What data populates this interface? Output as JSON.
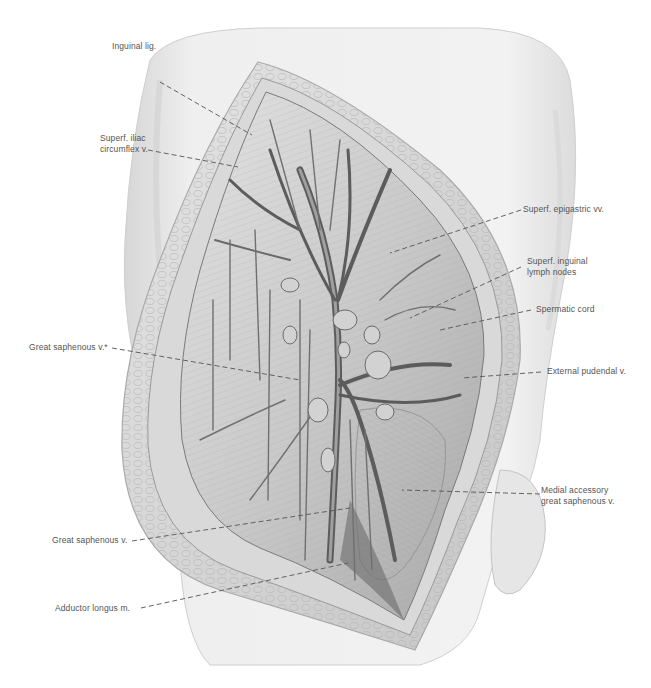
{
  "figure": {
    "colors": {
      "background": "#ffffff",
      "skin": "#ececec",
      "skin_shadow": "#c8c8c8",
      "wound_edge": "#d4d4d4",
      "fat_lobules": "#bdbdbd",
      "muscle": "#9a9a9a",
      "vessel": "#6e6e6e",
      "vessel_dark": "#3a3a3a",
      "label_text": "#555555",
      "leader_line": "#555555"
    }
  },
  "labels": [
    {
      "id": "inguinal-lig",
      "text": "Inguinal lig.",
      "side": "left"
    },
    {
      "id": "superf-iliac-circumflex-v",
      "line1": "Superf. iliac",
      "line2": "circumflex v.",
      "side": "left"
    },
    {
      "id": "superf-epigastric-vv",
      "text": "Superf. epigastric vv.",
      "side": "right"
    },
    {
      "id": "superf-inguinal-lymph-nodes",
      "line1": "Superf. inguinal",
      "line2": "lymph nodes",
      "side": "right"
    },
    {
      "id": "spermatic-cord",
      "text": "Spermatic cord",
      "side": "right"
    },
    {
      "id": "great-saphenous-v-star",
      "text": "Great saphenous v.*",
      "side": "left"
    },
    {
      "id": "external-pudendal-v",
      "text": "External pudendal v.",
      "side": "right"
    },
    {
      "id": "medial-accessory-great-saphenous-v",
      "line1": "Medial accessory",
      "line2": "great saphenous v.",
      "side": "right"
    },
    {
      "id": "great-saphenous-v",
      "text": "Great saphenous v.",
      "side": "left"
    },
    {
      "id": "adductor-longus-m",
      "text": "Adductor longus m.",
      "side": "left"
    }
  ]
}
